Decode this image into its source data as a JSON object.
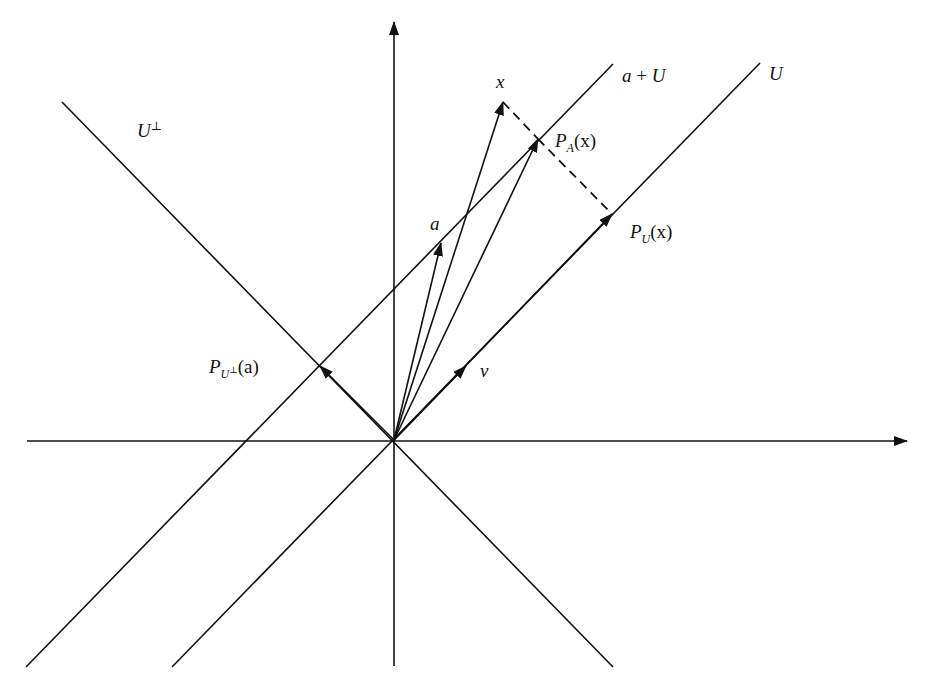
{
  "figure": {
    "colors": {
      "stroke": "#111111",
      "background": "#ffffff"
    }
  },
  "labels": {
    "x": "x",
    "a_plus_U": {
      "a": "a",
      "plus": " + ",
      "U": "U"
    },
    "U": "U",
    "U_perp": {
      "base": "U",
      "sup": "⊥"
    },
    "P_A_x": {
      "P": "P",
      "sub": "A",
      "arg": "(x)"
    },
    "P_U_x": {
      "P": "P",
      "sub": "U",
      "arg": "(x)"
    },
    "a": "a",
    "v": "v",
    "P_Uperp_a": {
      "P": "P",
      "sub": "U",
      "subsup": "⊥",
      "arg": "(a)"
    }
  },
  "geometry": {
    "origin": [
      394,
      440
    ],
    "axes": {
      "vertical": {
        "from": [
          394,
          666
        ],
        "to": [
          394,
          22
        ]
      },
      "horizontal": {
        "from": [
          27,
          441
        ],
        "to": [
          907,
          441
        ]
      }
    },
    "lines": {
      "U": {
        "from": [
          172,
          667
        ],
        "to": [
          760,
          63
        ]
      },
      "a_plus_U": {
        "from": [
          26,
          667
        ],
        "to": [
          613,
          64
        ]
      },
      "U_perp": {
        "from": [
          62,
          102
        ],
        "to": [
          613,
          667
        ]
      }
    },
    "vectors": {
      "x": [
        503,
        102
      ],
      "P_A_x": [
        538,
        139
      ],
      "a": [
        441,
        243
      ],
      "P_U_x": [
        612,
        214
      ],
      "v": [
        466,
        366
      ],
      "P_Uperp_a": [
        320,
        366
      ]
    },
    "dashed": [
      [
        503,
        102
      ],
      [
        538,
        139
      ],
      [
        612,
        214
      ]
    ]
  }
}
